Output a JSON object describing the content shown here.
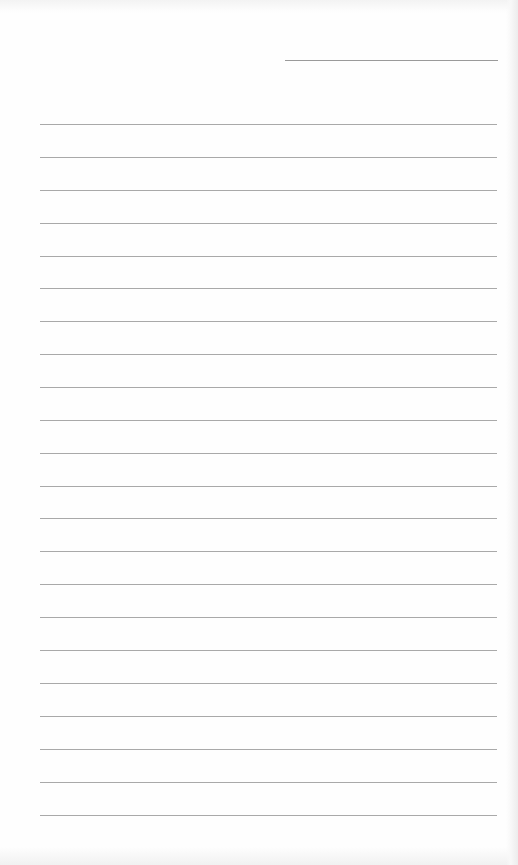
{
  "page": {
    "type": "ruled-paper",
    "background_color": "#fefefe",
    "line_color": "#9a9a9a"
  },
  "header_line": {
    "x_start": 285,
    "x_end": 498,
    "y": 60
  },
  "ruled_lines": {
    "count": 22,
    "x_start": 40,
    "x_end": 497,
    "first_y": 124,
    "spacing": 32.9,
    "y_positions": [
      124,
      157,
      190,
      223,
      256,
      288,
      321,
      354,
      387,
      420,
      453,
      486,
      518,
      551,
      584,
      617,
      650,
      683,
      716,
      749,
      782,
      815
    ]
  }
}
